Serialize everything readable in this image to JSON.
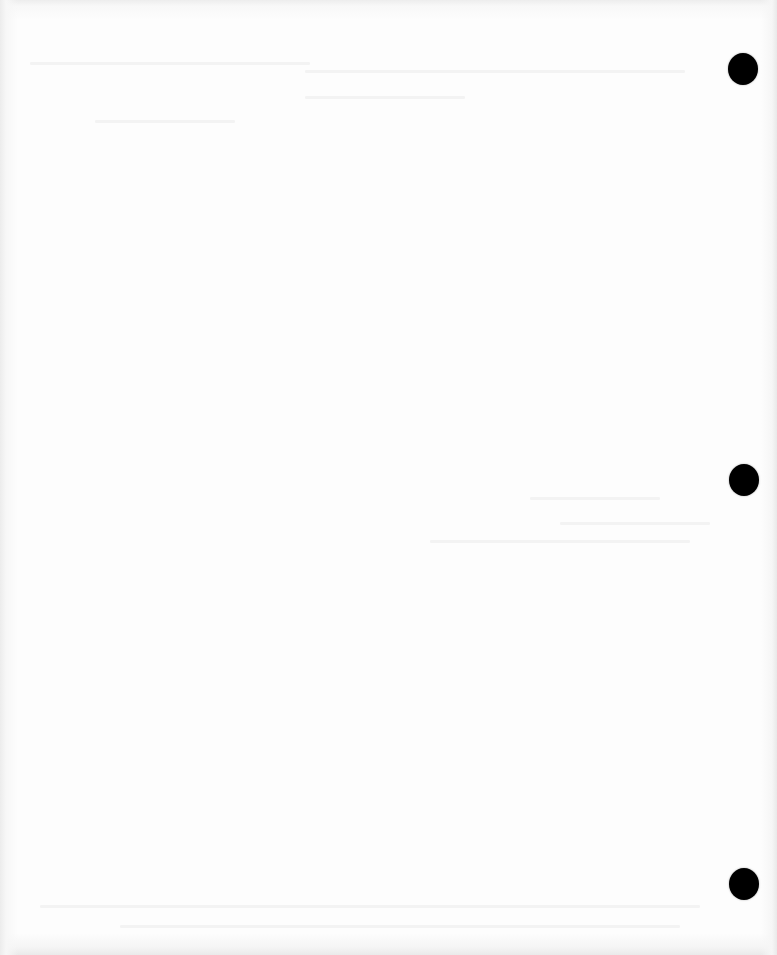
{
  "document": {
    "type": "scanned-blank-page",
    "background_color": "#fdfdfd",
    "text_content": ""
  },
  "punch_holes": [
    {
      "id": "top",
      "x": 728,
      "y": 53,
      "width": 30,
      "height": 32,
      "color": "#000000"
    },
    {
      "id": "middle",
      "x": 729,
      "y": 464,
      "width": 30,
      "height": 32,
      "color": "#000000"
    },
    {
      "id": "bottom",
      "x": 729,
      "y": 868,
      "width": 30,
      "height": 32,
      "color": "#000000"
    }
  ]
}
